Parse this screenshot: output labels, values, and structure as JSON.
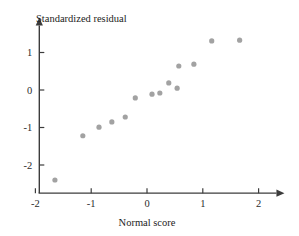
{
  "chart_data": {
    "type": "scatter",
    "title": "",
    "xlabel": "Normal score",
    "ylabel": "Standardized residual",
    "xlim": [
      -2.13,
      2.3
    ],
    "ylim": [
      -2.6,
      1.75
    ],
    "xticks": [
      -2,
      -1,
      0,
      1,
      2
    ],
    "xtick_labels": [
      "-2",
      "-1",
      "0",
      "1",
      "2"
    ],
    "yticks": [
      -2,
      -1,
      0,
      1
    ],
    "ytick_labels": [
      "-2",
      "-1",
      "0",
      "1"
    ],
    "grid": false,
    "legend": null,
    "marker": "circle",
    "marker_color": "#a2a2a2",
    "axis_color": "#3c3c3c",
    "points": [
      {
        "x": -1.65,
        "y": -2.4
      },
      {
        "x": -1.15,
        "y": -1.22
      },
      {
        "x": -0.86,
        "y": -0.99
      },
      {
        "x": -0.63,
        "y": -0.85
      },
      {
        "x": -0.39,
        "y": -0.72
      },
      {
        "x": -0.21,
        "y": -0.21
      },
      {
        "x": 0.09,
        "y": -0.11
      },
      {
        "x": 0.23,
        "y": -0.08
      },
      {
        "x": 0.39,
        "y": 0.19
      },
      {
        "x": 0.54,
        "y": 0.05
      },
      {
        "x": 0.57,
        "y": 0.64
      },
      {
        "x": 0.84,
        "y": 0.69
      },
      {
        "x": 1.16,
        "y": 1.31
      },
      {
        "x": 1.66,
        "y": 1.33
      }
    ]
  },
  "labels": {
    "y_axis_title": "Standardized residual",
    "x_axis_title": "Normal score"
  }
}
